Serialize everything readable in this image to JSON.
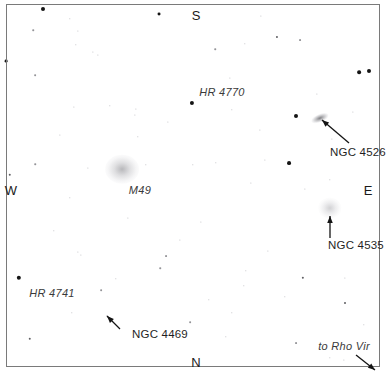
{
  "chart": {
    "background_color": "#ffffff",
    "border_color": "#7a7a7a",
    "star_color": "#1a1a1a",
    "label_color": "#3a3a3a"
  },
  "cardinals": {
    "north": "N",
    "south": "S",
    "east": "E",
    "west": "W"
  },
  "objects": [
    {
      "id": "hr4770",
      "label": "HR 4770",
      "type": "star"
    },
    {
      "id": "m49",
      "label": "M49",
      "type": "galaxy"
    },
    {
      "id": "hr4741",
      "label": "HR 4741",
      "type": "star"
    },
    {
      "id": "ngc4526",
      "label": "NGC 4526",
      "type": "galaxy"
    },
    {
      "id": "ngc4535",
      "label": "NGC 4535",
      "type": "galaxy"
    },
    {
      "id": "ngc4469",
      "label": "NGC 4469",
      "type": "galaxy"
    },
    {
      "id": "rhovir",
      "label": "to Rho Vir",
      "type": "pointer"
    }
  ],
  "chart_data": {
    "type": "scatter",
    "xlabel": "",
    "ylabel": "",
    "xlim": [
      0,
      386
    ],
    "ylim": [
      0,
      377
    ],
    "grid": false,
    "legend": "none",
    "orientation": {
      "top": "S",
      "bottom": "N",
      "left": "W",
      "right": "E"
    },
    "annotations": [
      {
        "text": "HR 4770",
        "x": 222,
        "y": 92,
        "arrow": false
      },
      {
        "text": "M49",
        "x": 140,
        "y": 190,
        "arrow": false
      },
      {
        "text": "HR 4741",
        "x": 52,
        "y": 293,
        "arrow": false
      },
      {
        "text": "NGC 4526",
        "x": 358,
        "y": 152,
        "arrow": true,
        "arrow_from": [
          349,
          143
        ],
        "arrow_to": [
          322,
          120
        ]
      },
      {
        "text": "NGC 4535",
        "x": 356,
        "y": 245,
        "arrow": true,
        "arrow_from": [
          330,
          238
        ],
        "arrow_to": [
          330,
          216
        ]
      },
      {
        "text": "NGC 4469",
        "x": 160,
        "y": 334,
        "arrow": true,
        "arrow_from": [
          120,
          329
        ],
        "arrow_to": [
          107,
          316
        ]
      },
      {
        "text": "to Rho Vir",
        "x": 344,
        "y": 346,
        "arrow": true,
        "arrow_from": [
          356,
          355
        ],
        "arrow_to": [
          375,
          370
        ]
      }
    ],
    "nebulous_objects": [
      {
        "name": "M49",
        "x": 122,
        "y": 169,
        "rx": 13,
        "ry": 11,
        "brightness": "bright-diffuse"
      },
      {
        "name": "NGC 4535",
        "x": 330,
        "y": 208,
        "rx": 9,
        "ry": 8,
        "brightness": "faint-diffuse"
      },
      {
        "name": "NGC 4526",
        "x": 320,
        "y": 118,
        "rx": 7,
        "ry": 3,
        "brightness": "elongated-streak"
      }
    ],
    "stars": [
      {
        "x": 43,
        "y": 9,
        "mag": 2.6
      },
      {
        "x": 159,
        "y": 14,
        "mag": 1.9
      },
      {
        "x": 277,
        "y": 37,
        "mag": 1.4
      },
      {
        "x": 300,
        "y": 40,
        "mag": 1.2
      },
      {
        "x": 359,
        "y": 72,
        "mag": 2.4
      },
      {
        "x": 369,
        "y": 71,
        "mag": 2.6
      },
      {
        "x": 6,
        "y": 61,
        "mag": 1.8
      },
      {
        "x": 33,
        "y": 30,
        "mag": 1.0
      },
      {
        "x": 70,
        "y": 19,
        "mag": 0.9
      },
      {
        "x": 78,
        "y": 31,
        "mag": 0.8
      },
      {
        "x": 76,
        "y": 45,
        "mag": 0.9
      },
      {
        "x": 98,
        "y": 55,
        "mag": 0.8
      },
      {
        "x": 215,
        "y": 49,
        "mag": 1.0
      },
      {
        "x": 245,
        "y": 44,
        "mag": 0.9
      },
      {
        "x": 93,
        "y": 52,
        "mag": 0.8
      },
      {
        "x": 35,
        "y": 75,
        "mag": 1.1
      },
      {
        "x": 192,
        "y": 103,
        "mag": 2.7
      },
      {
        "x": 296,
        "y": 116,
        "mag": 2.6
      },
      {
        "x": 289,
        "y": 163,
        "mag": 2.5
      },
      {
        "x": 110,
        "y": 106,
        "mag": 0.9
      },
      {
        "x": 136,
        "y": 109,
        "mag": 0.8
      },
      {
        "x": 135,
        "y": 115,
        "mag": 0.8
      },
      {
        "x": 232,
        "y": 110,
        "mag": 0.9
      },
      {
        "x": 260,
        "y": 130,
        "mag": 0.8
      },
      {
        "x": 74,
        "y": 107,
        "mag": 0.8
      },
      {
        "x": 138,
        "y": 137,
        "mag": 0.9
      },
      {
        "x": 10,
        "y": 175,
        "mag": 1.6
      },
      {
        "x": 146,
        "y": 165,
        "mag": 0.9
      },
      {
        "x": 193,
        "y": 165,
        "mag": 0.9
      },
      {
        "x": 216,
        "y": 163,
        "mag": 0.9
      },
      {
        "x": 265,
        "y": 160,
        "mag": 0.8
      },
      {
        "x": 330,
        "y": 180,
        "mag": 0.9
      },
      {
        "x": 35,
        "y": 164,
        "mag": 1.0
      },
      {
        "x": 251,
        "y": 183,
        "mag": 0.8
      },
      {
        "x": 305,
        "y": 189,
        "mag": 0.8
      },
      {
        "x": 70,
        "y": 198,
        "mag": 0.9
      },
      {
        "x": 128,
        "y": 218,
        "mag": 0.8
      },
      {
        "x": 54,
        "y": 231,
        "mag": 0.9
      },
      {
        "x": 78,
        "y": 252,
        "mag": 0.8
      },
      {
        "x": 81,
        "y": 255,
        "mag": 0.8
      },
      {
        "x": 166,
        "y": 256,
        "mag": 1.2
      },
      {
        "x": 160,
        "y": 268,
        "mag": 1.0
      },
      {
        "x": 246,
        "y": 271,
        "mag": 0.9
      },
      {
        "x": 303,
        "y": 278,
        "mag": 1.5
      },
      {
        "x": 345,
        "y": 278,
        "mag": 0.8
      },
      {
        "x": 19,
        "y": 278,
        "mag": 2.8
      },
      {
        "x": 116,
        "y": 279,
        "mag": 0.9
      },
      {
        "x": 244,
        "y": 286,
        "mag": 0.9
      },
      {
        "x": 268,
        "y": 251,
        "mag": 0.8
      },
      {
        "x": 101,
        "y": 290,
        "mag": 1.1
      },
      {
        "x": 209,
        "y": 300,
        "mag": 0.9
      },
      {
        "x": 285,
        "y": 297,
        "mag": 0.9
      },
      {
        "x": 345,
        "y": 303,
        "mag": 1.3
      },
      {
        "x": 232,
        "y": 313,
        "mag": 0.9
      },
      {
        "x": 72,
        "y": 313,
        "mag": 0.9
      },
      {
        "x": 107,
        "y": 316,
        "mag": 0.9
      },
      {
        "x": 30,
        "y": 339,
        "mag": 1.6
      },
      {
        "x": 190,
        "y": 322,
        "mag": 1.1
      },
      {
        "x": 226,
        "y": 337,
        "mag": 0.9
      },
      {
        "x": 296,
        "y": 343,
        "mag": 1.2
      },
      {
        "x": 364,
        "y": 325,
        "mag": 0.9
      },
      {
        "x": 330,
        "y": 358,
        "mag": 0.9
      },
      {
        "x": 344,
        "y": 360,
        "mag": 0.8
      },
      {
        "x": 261,
        "y": 16,
        "mag": 0.8
      },
      {
        "x": 317,
        "y": 94,
        "mag": 0.8
      },
      {
        "x": 353,
        "y": 112,
        "mag": 0.8
      },
      {
        "x": 332,
        "y": 139,
        "mag": 0.8
      },
      {
        "x": 230,
        "y": 78,
        "mag": 0.8
      },
      {
        "x": 168,
        "y": 122,
        "mag": 0.8
      },
      {
        "x": 60,
        "y": 135,
        "mag": 0.8
      },
      {
        "x": 201,
        "y": 222,
        "mag": 0.8
      },
      {
        "x": 88,
        "y": 168,
        "mag": 0.8
      },
      {
        "x": 180,
        "y": 240,
        "mag": 0.8
      }
    ]
  }
}
